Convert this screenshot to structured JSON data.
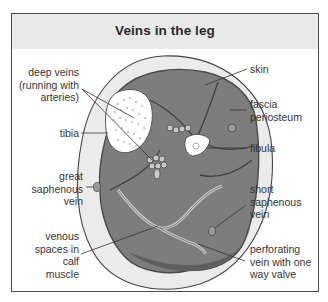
{
  "title": "Veins in the leg",
  "labels": {
    "deep_veins": [
      "deep veins",
      "(running with",
      "arteries)"
    ],
    "tibia": "tibia",
    "great_saphenous": [
      "great",
      "saphenous",
      "vein"
    ],
    "venous_spaces": [
      "venous",
      "spaces in",
      "calf",
      "muscle"
    ],
    "skin": "skin",
    "fascia": [
      "fascia",
      "periosteum"
    ],
    "fibula": "fibula",
    "short_saphenous": [
      "short",
      "saphenous",
      "vein"
    ],
    "perforating": [
      "perforating",
      "vein with one",
      "way valve"
    ]
  },
  "colors": {
    "header_bg": "#e9e9e9",
    "skin_fill": "#ebebeb",
    "muscle_fill": "#7d7d7d",
    "muscle_dark": "#5e5e5e",
    "bone_fill": "#ffffff",
    "vein_light": "#c9c9c9"
  }
}
